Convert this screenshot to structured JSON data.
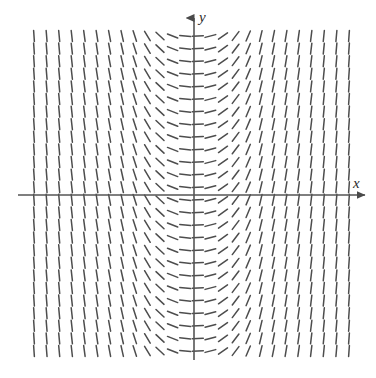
{
  "figure": {
    "type": "slope-field",
    "title": "",
    "background_color": "#ffffff",
    "width": 376,
    "height": 378
  },
  "axes": {
    "x_axis": {
      "label": "x",
      "color": "#555555",
      "line_width": 1.6,
      "y_pixel": 195,
      "x_start_pixel": 18,
      "x_end_pixel": 365,
      "arrow": "right",
      "label_left_pixel": 353,
      "label_top_pixel": 176
    },
    "y_axis": {
      "label": "y",
      "color": "#555555",
      "line_width": 1.6,
      "x_pixel": 194,
      "y_start_pixel": 360,
      "y_end_pixel": 18,
      "arrow": "up",
      "label_left_pixel": 199,
      "label_top_pixel": 10
    },
    "origin_pixel": {
      "x": 194,
      "y": 195
    }
  },
  "chart_data": {
    "type": "line",
    "plot_kind": "slope-field",
    "title": "",
    "xlabel": "x",
    "ylabel": "y",
    "grid": false,
    "legend": null,
    "xlim": [
      -4,
      4
    ],
    "ylim": [
      -4,
      4
    ],
    "xticks": [],
    "yticks": [],
    "annotations": [],
    "tick_mark": {
      "length_px": 11,
      "color": "#4d4d4d",
      "line_width": 1.5,
      "cap": "round"
    },
    "grid_layout": {
      "columns": 26,
      "rows": 26,
      "x_start_px": 34,
      "y_start_px": 36,
      "spacing_px": 12.6,
      "x_step_data": 0.32,
      "y_step_data": 0.32
    },
    "slope_rule": {
      "description": "dy/dx depends only on x; zero slope on the y-axis, steepening to near-vertical toward the left and right edges",
      "formula": "dy/dx = x^3",
      "sign_left": "negative",
      "sign_right": "positive",
      "sign_center": "zero"
    },
    "sample_slopes": [
      {
        "x": -4.0,
        "angle_deg": -86
      },
      {
        "x": -3.2,
        "angle_deg": -84
      },
      {
        "x": -2.4,
        "angle_deg": -81
      },
      {
        "x": -1.6,
        "angle_deg": -76
      },
      {
        "x": -1.2,
        "angle_deg": -60
      },
      {
        "x": -0.8,
        "angle_deg": -40
      },
      {
        "x": -0.5,
        "angle_deg": -18
      },
      {
        "x": -0.2,
        "angle_deg": -5
      },
      {
        "x": 0.0,
        "angle_deg": 0
      },
      {
        "x": 0.2,
        "angle_deg": 5
      },
      {
        "x": 0.5,
        "angle_deg": 18
      },
      {
        "x": 0.8,
        "angle_deg": 40
      },
      {
        "x": 1.2,
        "angle_deg": 60
      },
      {
        "x": 1.6,
        "angle_deg": 76
      },
      {
        "x": 2.4,
        "angle_deg": 81
      },
      {
        "x": 3.2,
        "angle_deg": 84
      },
      {
        "x": 4.0,
        "angle_deg": 86
      }
    ]
  },
  "colors": {
    "axis": "#555555",
    "tick": "#4d4d4d",
    "label": "#2b2b2b",
    "background": "#ffffff"
  }
}
